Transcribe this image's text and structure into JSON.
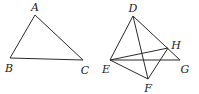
{
  "figures": [
    {
      "name": "triangle-abc",
      "points": {
        "A": {
          "x": 35,
          "y": 15
        },
        "B": {
          "x": 10,
          "y": 58
        },
        "C": {
          "x": 83,
          "y": 60
        }
      },
      "segments": [
        [
          "A",
          "B"
        ],
        [
          "B",
          "C"
        ],
        [
          "A",
          "C"
        ]
      ],
      "labels": [
        {
          "text": "A",
          "x": 35,
          "y": 7
        },
        {
          "text": "B",
          "x": 9,
          "y": 68
        },
        {
          "text": "C",
          "x": 85,
          "y": 70
        }
      ]
    },
    {
      "name": "figure-defgh",
      "points": {
        "D": {
          "x": 133,
          "y": 16
        },
        "E": {
          "x": 110,
          "y": 60
        },
        "F": {
          "x": 148,
          "y": 79
        },
        "G": {
          "x": 180,
          "y": 60
        },
        "H": {
          "x": 168,
          "y": 48
        }
      },
      "segments": [
        [
          "D",
          "E"
        ],
        [
          "D",
          "F"
        ],
        [
          "D",
          "G"
        ],
        [
          "E",
          "H"
        ],
        [
          "E",
          "G"
        ],
        [
          "E",
          "F"
        ],
        [
          "F",
          "H"
        ]
      ],
      "labels": [
        {
          "text": "D",
          "x": 133,
          "y": 8
        },
        {
          "text": "E",
          "x": 106,
          "y": 69
        },
        {
          "text": "F",
          "x": 148,
          "y": 88
        },
        {
          "text": "G",
          "x": 185,
          "y": 69
        },
        {
          "text": "H",
          "x": 176,
          "y": 45
        }
      ]
    }
  ],
  "style": {
    "line_color": "#2b2b2b",
    "label_color": "#222222",
    "background": "#ffffff"
  }
}
